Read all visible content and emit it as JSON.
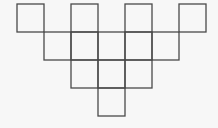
{
  "diagram": {
    "stroke_color": "#4a4a4a",
    "background": "#f7f7f7",
    "stroke_width": 1.3,
    "cell_w": 27,
    "cell_h": 28,
    "origin_x": 17,
    "origin_y": 4,
    "rows": [
      {
        "row": 0,
        "cols": [
          0,
          2,
          4,
          6
        ]
      },
      {
        "row": 1,
        "cols": [
          1,
          2,
          3,
          4,
          5
        ]
      },
      {
        "row": 2,
        "cols": [
          2,
          3,
          4
        ]
      },
      {
        "row": 3,
        "cols": [
          3
        ]
      }
    ],
    "square_count": 13
  }
}
